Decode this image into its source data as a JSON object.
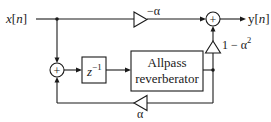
{
  "diagram": {
    "type": "signal-flow block diagram",
    "input": {
      "label_var": "x",
      "label_arg": "n"
    },
    "output": {
      "label_var": "y",
      "label_arg": "n"
    },
    "feedforward_gain": {
      "label": "−α"
    },
    "output_gain": {
      "label_base": "1 − α",
      "label_exp": "2"
    },
    "feedback_gain": {
      "label": "α"
    },
    "delay": {
      "label_base": "z",
      "label_exp": "−1"
    },
    "reverberator": {
      "line1": "Allpass",
      "line2": "reverberator"
    },
    "summer_symbol": "+",
    "colors": {
      "line": "#1a1a1a",
      "background": "#ffffff"
    }
  }
}
